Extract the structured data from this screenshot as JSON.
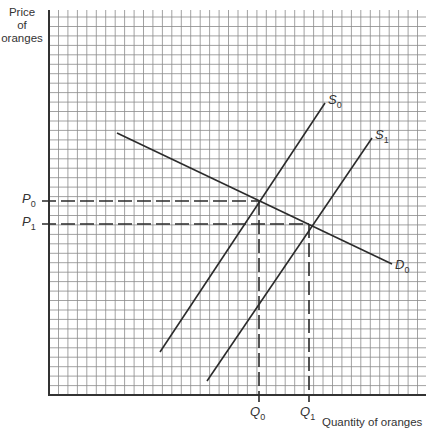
{
  "axes": {
    "y_label_lines": [
      "Price",
      "of",
      "oranges"
    ],
    "x_label": "Quantity of oranges"
  },
  "price_labels": [
    {
      "base": "P",
      "sub": "0",
      "y": 201
    },
    {
      "base": "P",
      "sub": "1",
      "y": 224
    }
  ],
  "quantity_labels": [
    {
      "base": "Q",
      "sub": "0",
      "x": 259
    },
    {
      "base": "Q",
      "sub": "1",
      "x": 309
    }
  ],
  "curves": [
    {
      "name": "S",
      "sub": "0",
      "type": "supply",
      "x1": 160,
      "y1": 352,
      "x2": 325,
      "y2": 103
    },
    {
      "name": "S",
      "sub": "1",
      "type": "supply",
      "x1": 207,
      "y1": 381,
      "x2": 372,
      "y2": 138
    },
    {
      "name": "D",
      "sub": "0",
      "type": "demand",
      "x1": 117,
      "y1": 133,
      "x2": 392,
      "y2": 264
    }
  ],
  "grid": {
    "x0": 49,
    "y0": 10,
    "x1": 426,
    "y1": 395,
    "cell": 9.45,
    "color": "#8a8a8a"
  },
  "colors": {
    "line": "#2b2b2b",
    "axis": "#333333"
  }
}
